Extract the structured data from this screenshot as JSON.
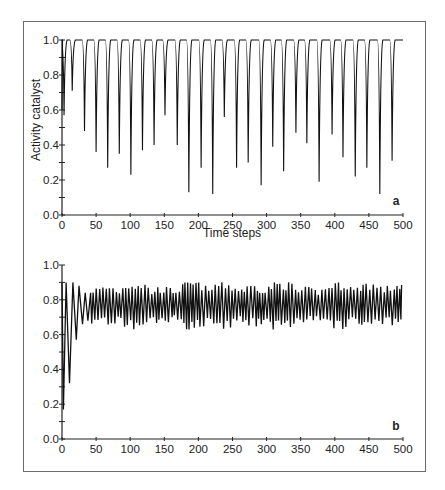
{
  "chart_data": [
    {
      "panel": "a",
      "type": "line",
      "title": "",
      "xlabel": "Time steps",
      "ylabel": "Activity catalyst",
      "xlim": [
        0,
        500
      ],
      "ylim": [
        0.0,
        1.0
      ],
      "xticks": [
        0,
        50,
        100,
        150,
        200,
        250,
        300,
        350,
        400,
        450,
        500
      ],
      "yticks": [
        0.0,
        0.2,
        0.4,
        0.6,
        0.8,
        1.0
      ],
      "ytick_labels": [
        "0.0",
        "0.2",
        "0.4",
        "0.6",
        "0.8",
        "1.0"
      ],
      "grid": false,
      "legend": null,
      "description": "Activity stays at 1.0 with periodic sharp downward spikes (about every 17 time steps) of varying depth",
      "baseline": 1.0,
      "dips": [
        {
          "t": 3,
          "v": 0.57
        },
        {
          "t": 15,
          "v": 0.71
        },
        {
          "t": 33,
          "v": 0.48
        },
        {
          "t": 50,
          "v": 0.36
        },
        {
          "t": 67,
          "v": 0.27
        },
        {
          "t": 84,
          "v": 0.35
        },
        {
          "t": 101,
          "v": 0.23
        },
        {
          "t": 118,
          "v": 0.37
        },
        {
          "t": 135,
          "v": 0.4
        },
        {
          "t": 151,
          "v": 0.57
        },
        {
          "t": 169,
          "v": 0.4
        },
        {
          "t": 186,
          "v": 0.13
        },
        {
          "t": 204,
          "v": 0.27
        },
        {
          "t": 221,
          "v": 0.12
        },
        {
          "t": 238,
          "v": 0.56
        },
        {
          "t": 256,
          "v": 0.27
        },
        {
          "t": 273,
          "v": 0.3
        },
        {
          "t": 292,
          "v": 0.17
        },
        {
          "t": 309,
          "v": 0.39
        },
        {
          "t": 325,
          "v": 0.25
        },
        {
          "t": 343,
          "v": 0.47
        },
        {
          "t": 359,
          "v": 0.41
        },
        {
          "t": 377,
          "v": 0.19
        },
        {
          "t": 396,
          "v": 0.46
        },
        {
          "t": 412,
          "v": 0.33
        },
        {
          "t": 430,
          "v": 0.22
        },
        {
          "t": 447,
          "v": 0.27
        },
        {
          "t": 466,
          "v": 0.12
        },
        {
          "t": 484,
          "v": 0.31
        }
      ]
    },
    {
      "panel": "b",
      "type": "line",
      "title": "",
      "xlabel": "",
      "ylabel": "",
      "xlim": [
        0,
        500
      ],
      "ylim": [
        0.0,
        1.0
      ],
      "xticks": [
        0,
        50,
        100,
        150,
        200,
        250,
        300,
        350,
        400,
        450,
        500
      ],
      "yticks": [
        0.0,
        0.2,
        0.4,
        0.6,
        0.8,
        1.0
      ],
      "ytick_labels": [
        "0.0",
        "0.2",
        "0.4",
        "0.6",
        "0.8",
        "1.0"
      ],
      "grid": false,
      "legend": null,
      "description": "Damped initial oscillation from ~0.17 settling into irregular fluctuation between ~0.63 and ~0.9 around a mean of ~0.77",
      "transient": [
        {
          "t": 0,
          "v": 0.9
        },
        {
          "t": 2,
          "v": 0.17
        },
        {
          "t": 6,
          "v": 0.9
        },
        {
          "t": 11,
          "v": 0.32
        },
        {
          "t": 16,
          "v": 0.9
        },
        {
          "t": 21,
          "v": 0.57
        },
        {
          "t": 25,
          "v": 0.88
        },
        {
          "t": 30,
          "v": 0.66
        },
        {
          "t": 34,
          "v": 0.84
        },
        {
          "t": 38,
          "v": 0.68
        },
        {
          "t": 42,
          "v": 0.84
        }
      ],
      "steady_state": {
        "mean": 0.77,
        "min": 0.63,
        "max": 0.9,
        "period_steps": 4.5
      }
    }
  ],
  "panels": {
    "a": {
      "letter": "a",
      "xlabel": "Time steps",
      "ylabel": "Activity catalyst"
    },
    "b": {
      "letter": "b"
    }
  },
  "style": {
    "line_color": "#111111",
    "axis_color": "#222222",
    "frame_color": "#6a6a6a"
  }
}
